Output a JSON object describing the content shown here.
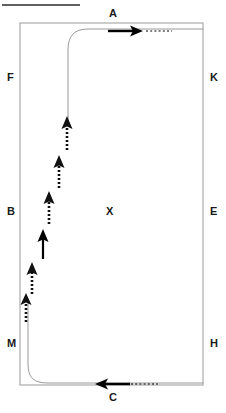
{
  "canvas": {
    "width": 226,
    "height": 413,
    "background": "#ffffff"
  },
  "title_rule": {
    "name": "top-divider-rule",
    "x1": 2,
    "y1": 5,
    "x2": 80,
    "y2": 5,
    "color": "#2b2b2b",
    "thickness": 1.6
  },
  "arena": {
    "name": "dressage-arena",
    "x": 20,
    "y": 23,
    "width": 183,
    "height": 362,
    "border_color": "#9a9a9a",
    "border_thickness": 1
  },
  "letters": [
    {
      "id": "A",
      "label": "A",
      "x": 109,
      "y": 8,
      "position": "top-center"
    },
    {
      "id": "F",
      "label": "F",
      "x": 7,
      "y": 72,
      "position": "left-upper"
    },
    {
      "id": "K",
      "label": "K",
      "x": 210,
      "y": 72,
      "position": "right-upper"
    },
    {
      "id": "B",
      "label": "B",
      "x": 7,
      "y": 206,
      "position": "left-middle"
    },
    {
      "id": "X",
      "label": "X",
      "x": 106,
      "y": 206,
      "position": "center"
    },
    {
      "id": "E",
      "label": "E",
      "x": 210,
      "y": 206,
      "position": "right-middle"
    },
    {
      "id": "M",
      "label": "M",
      "x": 7,
      "y": 338,
      "position": "left-lower"
    },
    {
      "id": "H",
      "label": "H",
      "x": 210,
      "y": 338,
      "position": "right-lower"
    },
    {
      "id": "C",
      "label": "C",
      "x": 109,
      "y": 392,
      "position": "bottom-center"
    }
  ],
  "track_path": {
    "name": "ridden-track-path",
    "color": "#9a9a9a",
    "thickness": 1,
    "segments": [
      {
        "name": "top-entry-into-centerline",
        "d": "M 203 29 L 88 29 C 74 29 68 36 68 50 L 68 125"
      },
      {
        "name": "bottom-exit-from-long-side",
        "d": "M 28 300 L 28 364 C 28 378 34 383 48 383 L 203 383"
      }
    ]
  },
  "solid_arrows": [
    {
      "name": "entry-arrow-top",
      "direction": "right",
      "color": "#000000",
      "shaft": {
        "x1": 110,
        "y1": 31,
        "x2": 136,
        "y2": 31
      },
      "head": {
        "tip_x": 142,
        "tip_y": 31
      },
      "dotted_tail": {
        "x1": 145,
        "y1": 31,
        "x2": 171,
        "y2": 31
      }
    },
    {
      "name": "exit-arrow-bottom",
      "direction": "left",
      "color": "#000000",
      "shaft": {
        "x1": 129,
        "y1": 384,
        "x2": 102,
        "y2": 384
      },
      "head": {
        "tip_x": 96,
        "tip_y": 384
      },
      "dotted_tail": {
        "x1": 132,
        "y1": 384,
        "x2": 157,
        "y2": 384
      }
    },
    {
      "name": "movement-arrow-solid-up",
      "direction": "up",
      "color": "#000000",
      "shaft": {
        "x1": 43,
        "y1": 259,
        "x2": 43,
        "y2": 236
      },
      "head": {
        "tip_x": 43,
        "tip_y": 230
      }
    }
  ],
  "dotted_arrows": [
    {
      "name": "half-pass-step-1",
      "direction": "up",
      "color": "#111111",
      "x": 67,
      "y_bottom": 150,
      "y_top": 116
    },
    {
      "name": "half-pass-step-2",
      "direction": "up",
      "color": "#111111",
      "x": 59,
      "y_bottom": 188,
      "y_top": 156
    },
    {
      "name": "half-pass-step-3",
      "direction": "up",
      "color": "#111111",
      "x": 49,
      "y_bottom": 224,
      "y_top": 192
    },
    {
      "name": "half-pass-step-4",
      "direction": "up",
      "color": "#111111",
      "x": 32,
      "y_bottom": 294,
      "y_top": 263
    },
    {
      "name": "half-pass-step-5",
      "direction": "up",
      "color": "#111111",
      "x": 26,
      "y_bottom": 322,
      "y_top": 294
    }
  ]
}
